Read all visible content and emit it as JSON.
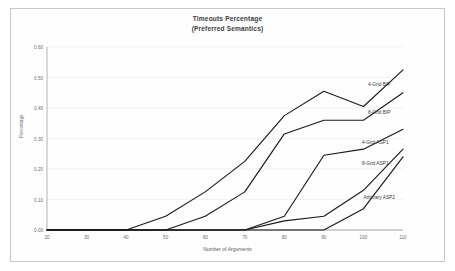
{
  "chart_data": {
    "type": "line",
    "title": "Timeouts Percentage",
    "subtitle": "(Preferred Semantics)",
    "xlabel": "Number of Arguments",
    "ylabel": "Percentage",
    "x": [
      20,
      30,
      40,
      50,
      60,
      70,
      80,
      90,
      100,
      110
    ],
    "xlim": [
      20,
      110
    ],
    "ylim": [
      0.0,
      0.6
    ],
    "yticks": [
      "0.00",
      "0.10",
      "0.20",
      "0.30",
      "0.40",
      "0.50",
      "0.60"
    ],
    "ytick_values": [
      0.0,
      0.1,
      0.2,
      0.3,
      0.4,
      0.5,
      0.6
    ],
    "xticks": [
      "20",
      "30",
      "40",
      "50",
      "60",
      "70",
      "80",
      "90",
      "100",
      "110"
    ],
    "grid": true,
    "legend": "inline-labels",
    "series": [
      {
        "name": "4-Grid BIP",
        "color": "#1a1a1a",
        "values": [
          0.0,
          0.0,
          0.0,
          0.045,
          0.125,
          0.225,
          0.375,
          0.455,
          0.405,
          0.525
        ],
        "label_x": 104,
        "label_y": 0.475
      },
      {
        "name": "8-Grid BIP",
        "color": "#1a1a1a",
        "values": [
          0.0,
          0.0,
          0.0,
          0.0,
          0.045,
          0.125,
          0.315,
          0.36,
          0.36,
          0.45
        ],
        "label_x": 104,
        "label_y": 0.385
      },
      {
        "name": "4-Grid ASP1",
        "color": "#1a1a1a",
        "values": [
          0.0,
          0.0,
          0.0,
          0.0,
          0.0,
          0.0,
          0.045,
          0.245,
          0.265,
          0.33
        ],
        "label_x": 103,
        "label_y": 0.285
      },
      {
        "name": "8-Grid ASP1",
        "color": "#1a1a1a",
        "values": [
          0.0,
          0.0,
          0.0,
          0.0,
          0.0,
          0.0,
          0.03,
          0.045,
          0.13,
          0.265
        ],
        "label_x": 103,
        "label_y": 0.215
      },
      {
        "name": "Arbitrary ASP2",
        "color": "#1a1a1a",
        "values": [
          0.0,
          0.0,
          0.0,
          0.0,
          0.0,
          0.0,
          0.0,
          0.0,
          0.07,
          0.24
        ],
        "label_x": 104,
        "label_y": 0.105
      }
    ]
  }
}
